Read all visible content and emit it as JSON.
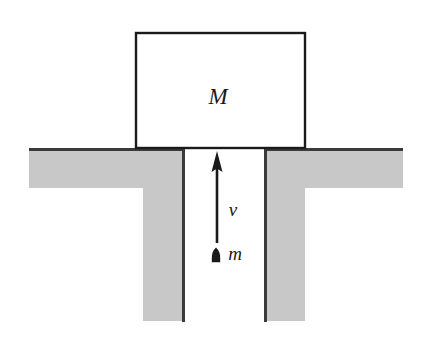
{
  "figure": {
    "background_color": "#ffffff",
    "width": 423,
    "height": 348
  },
  "colors": {
    "ground_fill": "#c8c8c8",
    "ground_edge": "#3a3a3a",
    "outline": "#1a1a1a",
    "label": "#1a1a1a",
    "background": "#ffffff"
  },
  "block": {
    "label": "M",
    "fill": "#ffffff",
    "stroke": "#1a1a1a",
    "x": 136,
    "y": 33,
    "width": 169,
    "height": 115
  },
  "ground": {
    "slab": {
      "x": 29,
      "y": 149,
      "width": 374,
      "height": 39
    },
    "left_wall": {
      "x": 143,
      "y": 149,
      "width": 42,
      "height": 172
    },
    "right_wall": {
      "x": 264,
      "y": 149,
      "width": 41,
      "height": 172
    },
    "gap_left": 185,
    "gap_right": 264
  },
  "velocity_arrow": {
    "label": "v",
    "x": 217,
    "tail_y": 243,
    "head_y": 152,
    "direction": "up",
    "label_x": 233,
    "label_y": 212
  },
  "bullet": {
    "label": "m",
    "x": 216,
    "y": 248,
    "width": 8,
    "height": 15,
    "label_x": 234,
    "label_y": 256
  }
}
